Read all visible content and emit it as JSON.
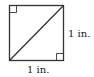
{
  "diagram": {
    "type": "square-with-diagonal",
    "side_label_right": "1 in.",
    "side_label_bottom": "1 in.",
    "right_angle_marks": [
      "top-left",
      "bottom-right"
    ],
    "stroke_color": "#333333",
    "background": "#ffffff"
  }
}
